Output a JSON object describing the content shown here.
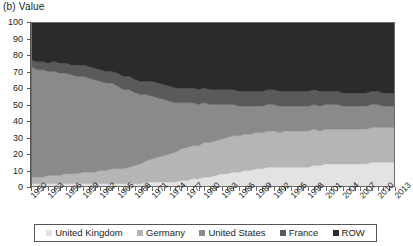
{
  "panel": {
    "title": "(b) Value"
  },
  "legend": {
    "position": "bottom",
    "items": [
      {
        "label": "United Kingdom",
        "color": "#e3e3e3"
      },
      {
        "label": "Germany",
        "color": "#b5b5b5"
      },
      {
        "label": "United States",
        "color": "#8a8a8a"
      },
      {
        "label": "France",
        "color": "#5a5a5a"
      },
      {
        "label": "ROW",
        "color": "#2b2b2b"
      }
    ]
  },
  "axes": {
    "y": {
      "label": "",
      "ticks": [
        "100",
        "90",
        "80",
        "70",
        "60",
        "50",
        "40",
        "30",
        "20",
        "10",
        "0"
      ],
      "min": 0,
      "max": 100
    },
    "x": {
      "label": "",
      "ticks": [
        "1950",
        "1953",
        "1956",
        "1959",
        "1962",
        "1965",
        "1968",
        "1971",
        "1974",
        "1977",
        "1980",
        "1983",
        "1986",
        "1989",
        "1992",
        "1995",
        "1998",
        "2001",
        "2004",
        "2007",
        "2010",
        "2013"
      ],
      "min": 1950,
      "max": 2013
    }
  },
  "chart_data": {
    "type": "area",
    "stacked": true,
    "normalized": true,
    "title": "(b) Value",
    "xlabel": "",
    "ylabel": "Value",
    "ylim": [
      0,
      100
    ],
    "xlim": [
      1950,
      2013
    ],
    "grid": false,
    "legend_position": "bottom",
    "x": [
      1950,
      1951,
      1952,
      1953,
      1954,
      1955,
      1956,
      1957,
      1958,
      1959,
      1960,
      1961,
      1962,
      1963,
      1964,
      1965,
      1966,
      1967,
      1968,
      1969,
      1970,
      1971,
      1972,
      1973,
      1974,
      1975,
      1976,
      1977,
      1978,
      1979,
      1980,
      1981,
      1982,
      1983,
      1984,
      1985,
      1986,
      1987,
      1988,
      1989,
      1990,
      1991,
      1992,
      1993,
      1994,
      1995,
      1996,
      1997,
      1998,
      1999,
      2000,
      2001,
      2002,
      2003,
      2004,
      2005,
      2006,
      2007,
      2008,
      2009,
      2010,
      2011,
      2012,
      2013
    ],
    "series": [
      {
        "name": "United Kingdom",
        "color": "#e3e3e3",
        "values": [
          2,
          2,
          2,
          2,
          2,
          2,
          2,
          2,
          2,
          2,
          2,
          2,
          2,
          2,
          2,
          2,
          2,
          2,
          2,
          2,
          3,
          3,
          3,
          3,
          3,
          3,
          4,
          4,
          5,
          5,
          6,
          6,
          7,
          8,
          8,
          9,
          9,
          10,
          10,
          11,
          11,
          12,
          12,
          12,
          12,
          12,
          12,
          12,
          12,
          13,
          13,
          14,
          14,
          14,
          14,
          14,
          14,
          14,
          14,
          15,
          15,
          15,
          15,
          15
        ]
      },
      {
        "name": "Germany",
        "color": "#b5b5b5",
        "values": [
          4,
          4,
          4,
          5,
          5,
          5,
          6,
          6,
          6,
          7,
          7,
          7,
          8,
          8,
          9,
          9,
          9,
          10,
          11,
          12,
          13,
          14,
          15,
          16,
          17,
          18,
          19,
          20,
          20,
          20,
          21,
          21,
          21,
          21,
          22,
          22,
          22,
          22,
          22,
          22,
          22,
          22,
          22,
          21,
          22,
          22,
          22,
          22,
          22,
          22,
          21,
          21,
          21,
          21,
          21,
          21,
          21,
          21,
          21,
          21,
          21,
          21,
          21,
          21
        ]
      },
      {
        "name": "United States",
        "color": "#8a8a8a",
        "values": [
          67,
          65,
          65,
          63,
          63,
          62,
          61,
          60,
          59,
          58,
          57,
          56,
          54,
          53,
          52,
          50,
          48,
          47,
          44,
          42,
          40,
          38,
          36,
          34,
          32,
          30,
          28,
          27,
          26,
          25,
          24,
          23,
          22,
          21,
          20,
          19,
          18,
          17,
          17,
          16,
          16,
          16,
          16,
          16,
          15,
          15,
          15,
          15,
          15,
          15,
          15,
          15,
          15,
          15,
          14,
          14,
          14,
          14,
          14,
          14,
          14,
          13,
          13,
          13
        ]
      },
      {
        "name": "France",
        "color": "#5a5a5a",
        "values": [
          4,
          5,
          5,
          5,
          6,
          6,
          6,
          6,
          7,
          7,
          7,
          7,
          7,
          7,
          7,
          8,
          8,
          8,
          8,
          8,
          8,
          9,
          9,
          9,
          9,
          9,
          9,
          9,
          9,
          9,
          9,
          9,
          9,
          9,
          9,
          9,
          9,
          9,
          9,
          9,
          9,
          9,
          9,
          9,
          9,
          9,
          9,
          9,
          9,
          9,
          9,
          8,
          8,
          8,
          8,
          8,
          8,
          8,
          8,
          8,
          8,
          8,
          8,
          8
        ]
      },
      {
        "name": "ROW",
        "color": "#2b2b2b",
        "values": [
          23,
          24,
          24,
          25,
          24,
          25,
          25,
          26,
          26,
          26,
          27,
          28,
          29,
          30,
          30,
          31,
          33,
          33,
          35,
          36,
          36,
          36,
          37,
          38,
          39,
          40,
          40,
          40,
          40,
          41,
          40,
          41,
          41,
          41,
          41,
          41,
          42,
          42,
          42,
          42,
          42,
          41,
          41,
          42,
          42,
          42,
          42,
          42,
          42,
          41,
          42,
          42,
          42,
          42,
          43,
          43,
          43,
          43,
          43,
          42,
          42,
          43,
          43,
          43
        ]
      }
    ]
  }
}
